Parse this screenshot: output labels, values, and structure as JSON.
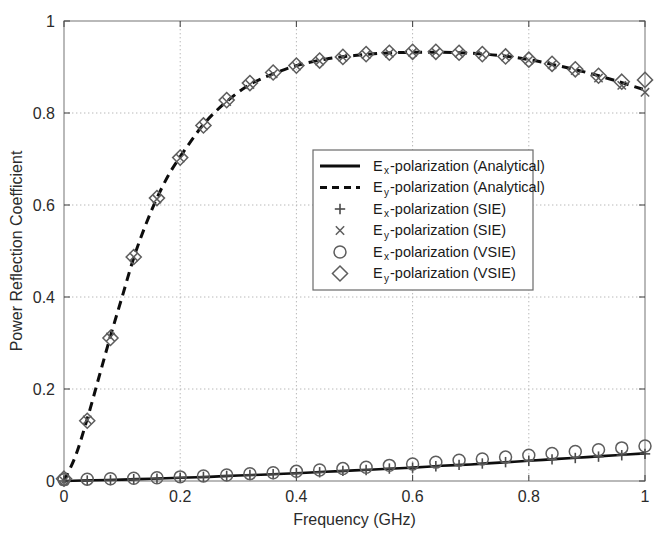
{
  "chart_data": {
    "type": "line",
    "title": "",
    "xlabel": "Frequency (GHz)",
    "ylabel": "Power Reflection Coefficient",
    "xlim": [
      0,
      1
    ],
    "ylim": [
      0,
      1
    ],
    "xticks": [
      "0",
      "0.2",
      "0.4",
      "0.6",
      "0.8",
      "1"
    ],
    "xtick_values": [
      0,
      0.2,
      0.4,
      0.6,
      0.8,
      1
    ],
    "yticks": [
      "0",
      "0.2",
      "0.4",
      "0.6",
      "0.8",
      "1"
    ],
    "ytick_values": [
      0,
      0.2,
      0.4,
      0.6,
      0.8,
      1
    ],
    "grid": true,
    "legend_position": "center",
    "series": [
      {
        "name": "Ex-polarization (Analytical)",
        "style": "solid-line",
        "x": [
          0,
          0.05,
          0.1,
          0.15,
          0.2,
          0.25,
          0.3,
          0.35,
          0.4,
          0.45,
          0.5,
          0.55,
          0.6,
          0.65,
          0.7,
          0.75,
          0.8,
          0.85,
          0.9,
          0.95,
          1
        ],
        "values": [
          0,
          0.0015,
          0.003,
          0.005,
          0.007,
          0.009,
          0.012,
          0.014,
          0.017,
          0.02,
          0.023,
          0.026,
          0.029,
          0.033,
          0.036,
          0.04,
          0.044,
          0.048,
          0.052,
          0.056,
          0.06
        ]
      },
      {
        "name": "Ey-polarization (Analytical)",
        "style": "dashed-line",
        "x": [
          0,
          0.02,
          0.04,
          0.06,
          0.08,
          0.1,
          0.12,
          0.14,
          0.16,
          0.18,
          0.2,
          0.24,
          0.28,
          0.32,
          0.36,
          0.4,
          0.45,
          0.5,
          0.55,
          0.6,
          0.65,
          0.7,
          0.75,
          0.8,
          0.85,
          0.9,
          0.95,
          1
        ],
        "values": [
          0,
          0.055,
          0.135,
          0.225,
          0.315,
          0.4,
          0.485,
          0.555,
          0.615,
          0.665,
          0.705,
          0.775,
          0.825,
          0.862,
          0.885,
          0.903,
          0.917,
          0.925,
          0.93,
          0.932,
          0.932,
          0.93,
          0.925,
          0.916,
          0.903,
          0.888,
          0.87,
          0.85
        ]
      },
      {
        "name": "Ex-polarization (SIE)",
        "style": "plus-marker",
        "x": [
          0,
          0.04,
          0.08,
          0.12,
          0.16,
          0.2,
          0.24,
          0.28,
          0.32,
          0.36,
          0.4,
          0.44,
          0.48,
          0.52,
          0.56,
          0.6,
          0.64,
          0.68,
          0.72,
          0.76,
          0.8,
          0.84,
          0.88,
          0.92,
          0.96,
          1
        ],
        "values": [
          0,
          0.001,
          0.002,
          0.004,
          0.005,
          0.007,
          0.009,
          0.011,
          0.013,
          0.015,
          0.017,
          0.019,
          0.022,
          0.024,
          0.027,
          0.029,
          0.032,
          0.035,
          0.038,
          0.041,
          0.044,
          0.047,
          0.05,
          0.053,
          0.056,
          0.059
        ]
      },
      {
        "name": "Ey-polarization (SIE)",
        "style": "cross-marker",
        "x": [
          0,
          0.04,
          0.08,
          0.12,
          0.16,
          0.2,
          0.24,
          0.28,
          0.32,
          0.36,
          0.4,
          0.44,
          0.48,
          0.52,
          0.56,
          0.6,
          0.64,
          0.68,
          0.72,
          0.76,
          0.8,
          0.84,
          0.88,
          0.92,
          0.96,
          1
        ],
        "values": [
          0,
          0.133,
          0.313,
          0.487,
          0.613,
          0.702,
          0.772,
          0.825,
          0.862,
          0.885,
          0.902,
          0.913,
          0.921,
          0.927,
          0.93,
          0.932,
          0.932,
          0.93,
          0.927,
          0.922,
          0.915,
          0.905,
          0.892,
          0.876,
          0.86,
          0.845
        ]
      },
      {
        "name": "Ex-polarization (VSIE)",
        "style": "circle-marker",
        "x": [
          0,
          0.04,
          0.08,
          0.12,
          0.16,
          0.2,
          0.24,
          0.28,
          0.32,
          0.36,
          0.4,
          0.44,
          0.48,
          0.52,
          0.56,
          0.6,
          0.64,
          0.68,
          0.72,
          0.76,
          0.8,
          0.84,
          0.88,
          0.92,
          0.96,
          1
        ],
        "values": [
          0.003,
          0.004,
          0.005,
          0.006,
          0.007,
          0.009,
          0.011,
          0.013,
          0.016,
          0.018,
          0.021,
          0.024,
          0.027,
          0.03,
          0.034,
          0.037,
          0.041,
          0.045,
          0.048,
          0.052,
          0.056,
          0.06,
          0.064,
          0.068,
          0.072,
          0.076
        ]
      },
      {
        "name": "Ey-polarization (VSIE)",
        "style": "diamond-marker",
        "x": [
          0,
          0.04,
          0.08,
          0.12,
          0.16,
          0.2,
          0.24,
          0.28,
          0.32,
          0.36,
          0.4,
          0.44,
          0.48,
          0.52,
          0.56,
          0.6,
          0.64,
          0.68,
          0.72,
          0.76,
          0.8,
          0.84,
          0.88,
          0.92,
          0.96,
          1
        ],
        "values": [
          0.005,
          0.131,
          0.311,
          0.487,
          0.615,
          0.703,
          0.773,
          0.828,
          0.865,
          0.888,
          0.903,
          0.914,
          0.922,
          0.928,
          0.931,
          0.933,
          0.933,
          0.931,
          0.928,
          0.923,
          0.916,
          0.907,
          0.895,
          0.881,
          0.868,
          0.872
        ]
      }
    ]
  },
  "legend": {
    "entries": [
      {
        "symbol_base": "E",
        "symbol_sub": "x",
        "label": "-polarization (Analytical)",
        "marker": "solid-line"
      },
      {
        "symbol_base": "E",
        "symbol_sub": "y",
        "label": "-polarization (Analytical)",
        "marker": "dashed-line"
      },
      {
        "symbol_base": "E",
        "symbol_sub": "x",
        "label": "-polarization (SIE)",
        "marker": "plus-marker"
      },
      {
        "symbol_base": "E",
        "symbol_sub": "y",
        "label": "-polarization (SIE)",
        "marker": "cross-marker"
      },
      {
        "symbol_base": "E",
        "symbol_sub": "x",
        "label": "-polarization (VSIE)",
        "marker": "circle-marker"
      },
      {
        "symbol_base": "E",
        "symbol_sub": "y",
        "label": "-polarization (VSIE)",
        "marker": "diamond-marker"
      }
    ]
  },
  "colors": {
    "curve": "#0d0d0d",
    "marker": "#5d5d5d",
    "axis": "#808080",
    "grid": "#b8b8b8",
    "text": "#2b2b2b",
    "background": "#ffffff"
  }
}
